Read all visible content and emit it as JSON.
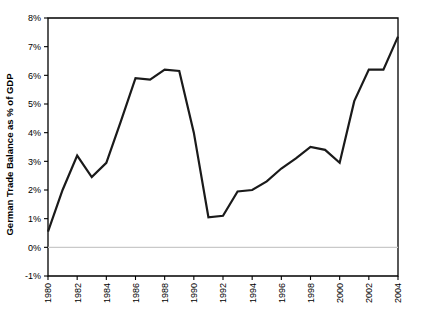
{
  "chart_data": {
    "type": "line",
    "title": "",
    "xlabel": "",
    "ylabel": "German Trade Balance as % of GDP",
    "ylim": [
      -1,
      8
    ],
    "xlim": [
      1980,
      2004
    ],
    "grid": false,
    "legend": "none",
    "y_tick_labels": [
      "8%",
      "7%",
      "6%",
      "5%",
      "4%",
      "3%",
      "2%",
      "1%",
      "0%",
      "-1%"
    ],
    "y_tick_values": [
      8,
      7,
      6,
      5,
      4,
      3,
      2,
      1,
      0,
      -1
    ],
    "x_tick_labels": [
      "1980",
      "1982",
      "1984",
      "1986",
      "1988",
      "1990",
      "1992",
      "1994",
      "1996",
      "1998",
      "2000",
      "2002",
      "2004"
    ],
    "x_tick_values": [
      1980,
      1982,
      1984,
      1986,
      1988,
      1990,
      1992,
      1994,
      1996,
      1998,
      2000,
      2002,
      2004
    ],
    "x": [
      1980,
      1981,
      1982,
      1983,
      1984,
      1985,
      1986,
      1987,
      1988,
      1989,
      1990,
      1991,
      1992,
      1993,
      1994,
      1995,
      1996,
      1997,
      1998,
      1999,
      2000,
      2001,
      2002,
      2003,
      2004
    ],
    "series": [
      {
        "name": "German Trade Balance as % of GDP",
        "color": "#1a1a1a",
        "values": [
          0.55,
          2.0,
          3.2,
          2.45,
          2.95,
          4.4,
          5.9,
          5.85,
          6.2,
          6.15,
          4.0,
          1.05,
          1.1,
          1.95,
          2.0,
          2.3,
          2.75,
          3.1,
          3.5,
          3.4,
          2.95,
          5.1,
          6.2,
          6.2,
          7.35
        ]
      }
    ],
    "zero_line_color": "#c9c9c9",
    "axis_color": "#000000",
    "background_color": "#ffffff"
  }
}
